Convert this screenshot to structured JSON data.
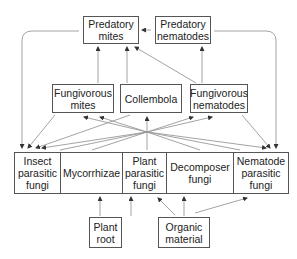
{
  "diagram": {
    "type": "soil food web",
    "top_row": [
      {
        "id": "predatory-mites",
        "label": "Predatory\nmites"
      },
      {
        "id": "predatory-nematodes",
        "label": "Predatory\nnematodes"
      }
    ],
    "middle_row": [
      {
        "id": "fungivorous-mites",
        "label": "Fungivorous\nmites"
      },
      {
        "id": "collembola",
        "label": "Collembola"
      },
      {
        "id": "fungivorous-nematodes",
        "label": "Fungivorous\nnematodes"
      }
    ],
    "fungi_row": [
      {
        "id": "insect-parasitic-fungi",
        "label": "Insect\nparasitic\nfungi"
      },
      {
        "id": "mycorrhizae",
        "label": "Mycorrhizae"
      },
      {
        "id": "plant-parasitic-fungi",
        "label": "Plant\nparasitic\nfungi"
      },
      {
        "id": "decomposer-fungi",
        "label": "Decomposer\nfungi"
      },
      {
        "id": "nematode-parasitic-fungi",
        "label": "Nematode\nparasitic\nfungi"
      }
    ],
    "bottom_row": [
      {
        "id": "plant-root",
        "label": "Plant\nroot"
      },
      {
        "id": "organic-material",
        "label": "Organic\nmaterial"
      }
    ],
    "edges": [
      [
        "predatory-nematodes",
        "predatory-mites"
      ],
      [
        "fungivorous-mites",
        "predatory-mites"
      ],
      [
        "collembola",
        "predatory-mites"
      ],
      [
        "fungivorous-nematodes",
        "predatory-mites"
      ],
      [
        "fungivorous-nematodes",
        "predatory-nematodes"
      ],
      [
        "predatory-mites",
        "insect-parasitic-fungi"
      ],
      [
        "predatory-nematodes",
        "nematode-parasitic-fungi"
      ],
      [
        "fungivorous-mites",
        "insect-parasitic-fungi"
      ],
      [
        "collembola",
        "insect-parasitic-fungi"
      ],
      [
        "fungivorous-nematodes",
        "insect-parasitic-fungi"
      ],
      [
        "fungivorous-nematodes",
        "nematode-parasitic-fungi"
      ],
      [
        "fungi",
        "fungivorous-mites"
      ],
      [
        "fungi",
        "collembola"
      ],
      [
        "fungi",
        "fungivorous-nematodes"
      ],
      [
        "plant-root",
        "mycorrhizae"
      ],
      [
        "plant-root",
        "plant-parasitic-fungi"
      ],
      [
        "organic-material",
        "plant-parasitic-fungi"
      ],
      [
        "organic-material",
        "decomposer-fungi"
      ],
      [
        "organic-material",
        "nematode-parasitic-fungi"
      ]
    ]
  }
}
